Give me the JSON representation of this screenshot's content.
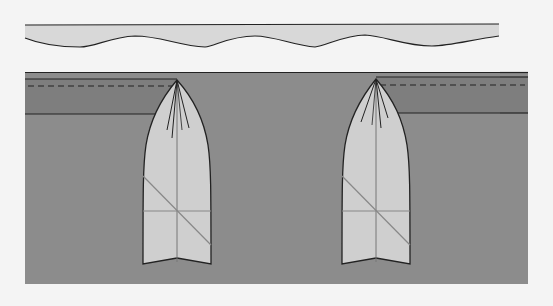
{
  "diagram": {
    "title": "",
    "type": "sewing-pleat-illustration",
    "colors": {
      "background": "#f4f4f4",
      "strip_fill": "#d8d8d8",
      "panel_fill": "#8c8c8c",
      "band_fill": "#7e7e7e",
      "pleat_fill": "#cfcfcf",
      "outline": "#222222",
      "guide_line": "#8a8a8a"
    },
    "elements": {
      "wavy_strip": {
        "label": ""
      },
      "fabric_panel": {
        "label": ""
      },
      "waistband_left": {
        "label": ""
      },
      "waistband_right": {
        "label": ""
      },
      "pleat_left": {
        "label": ""
      },
      "pleat_right": {
        "label": ""
      }
    }
  }
}
